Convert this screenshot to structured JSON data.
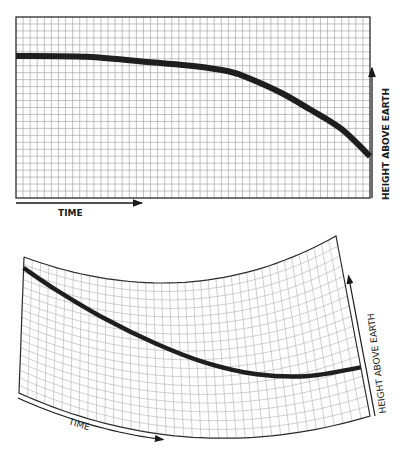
{
  "chart_data": [
    {
      "type": "line",
      "title": "",
      "xlabel": "TIME",
      "ylabel": "HEIGHT ABOVE EARTH",
      "grid": true,
      "grid_divisions": {
        "x": 50,
        "y": 26
      },
      "xlim": [
        0,
        1
      ],
      "ylim": [
        0,
        1
      ],
      "series": [
        {
          "name": "trajectory",
          "x": [
            0,
            0.2,
            0.38,
            0.5,
            0.6,
            0.66,
            0.75,
            0.83,
            0.92,
            1.0
          ],
          "y": [
            0.785,
            0.78,
            0.75,
            0.73,
            0.7,
            0.66,
            0.58,
            0.49,
            0.38,
            0.23
          ]
        }
      ],
      "colors": {
        "grid": "#9a9a9a",
        "curve": "#1e1e1e",
        "frame": "#2a2a2a"
      }
    },
    {
      "type": "line",
      "title": "",
      "xlabel": "TIME",
      "ylabel": "HEIGHT ABOVE EARTH",
      "grid": true,
      "distortion": "curved sheet",
      "grid_divisions": {
        "x": 40,
        "y": 18
      },
      "xlim": [
        0,
        1
      ],
      "ylim": [
        0,
        1
      ],
      "series": [
        {
          "name": "trajectory",
          "x": [
            0,
            0.1,
            0.25,
            0.4,
            0.55,
            0.7,
            0.85,
            1.0
          ],
          "y": [
            0.92,
            0.84,
            0.72,
            0.6,
            0.48,
            0.38,
            0.31,
            0.27
          ]
        }
      ],
      "colors": {
        "grid": "#a8a8a8",
        "curve": "#1e1e1e",
        "frame": "#2a2a2a"
      }
    }
  ]
}
